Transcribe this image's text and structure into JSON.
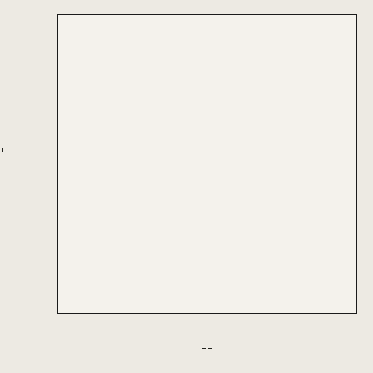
{
  "chart_data": {
    "type": "line",
    "title": "",
    "xlabel": "X = kθ / (ρ c r_m²) = αθ / r_m²",
    "ylabel": "Y_E = (t' - t_E) / (t' - t_b)",
    "xscale": "linear-then-compressed",
    "yscale": "log",
    "ylim": [
      0.01,
      1.0
    ],
    "xlim": [
      0,
      9
    ],
    "grid": true,
    "legend_position": "inline-curve-labels",
    "y_ticks": [
      "1.0",
      "0.8",
      "0.6",
      "0.5",
      "0.4",
      "0.3",
      "0.2",
      "0.15",
      "0.10",
      "0.08",
      "0.06",
      "0.05",
      "0.04",
      "0.03",
      "0.02",
      "0.015",
      "0.01"
    ],
    "y_tick_values": [
      1.0,
      0.8,
      0.6,
      0.5,
      0.4,
      0.3,
      0.2,
      0.15,
      0.1,
      0.08,
      0.06,
      0.05,
      0.04,
      0.03,
      0.02,
      0.015,
      0.01
    ],
    "x_ticks": [
      "0",
      "0.5",
      "1.0",
      "1.5",
      "2.0",
      "2.5",
      "3.0",
      "3.5",
      "4",
      "5",
      "6",
      "7",
      "8",
      "9"
    ],
    "x_tick_values": [
      0,
      0.5,
      1.0,
      1.5,
      2.0,
      2.5,
      3.0,
      3.5,
      4,
      5,
      6,
      7,
      8,
      9
    ],
    "series_parameter_symbol": "m",
    "series": [
      {
        "name": "m=80",
        "m": 80,
        "label": "m=80",
        "decay": 0.009,
        "break_x": 4.3
      },
      {
        "name": "50",
        "m": 50,
        "label": "50",
        "decay": 0.0142,
        "break_x": 4.25
      },
      {
        "name": "35",
        "m": 35,
        "label": "35",
        "decay": 0.0201,
        "break_x": 4.2
      },
      {
        "name": "25",
        "m": 25,
        "label": "25",
        "decay": 0.0278,
        "break_x": 4.15
      },
      {
        "name": "18",
        "m": 18,
        "label": "18",
        "decay": 0.0381,
        "break_x": 4.1
      },
      {
        "name": "14",
        "m": 14,
        "label": "14",
        "decay": 0.0486,
        "break_x": 4.05
      },
      {
        "name": "10",
        "m": 10,
        "label": "10",
        "decay": 0.067,
        "break_x": 4.0
      },
      {
        "name": "8",
        "m": 8,
        "label": "8",
        "decay": 0.083,
        "break_x": 3.95
      },
      {
        "name": "6.0",
        "m": 6.0,
        "label": "6.0",
        "decay": 0.109,
        "break_x": 3.9
      },
      {
        "name": "4.0",
        "m": 4.0,
        "label": "4.0",
        "decay": 0.158,
        "break_x": 3.85
      },
      {
        "name": "3.0",
        "m": 3.0,
        "label": "3.0",
        "decay": 0.205,
        "break_x": 3.8
      },
      {
        "name": "2.5",
        "m": 2.5,
        "label": "2.5",
        "decay": 0.242,
        "break_x": 3.75
      },
      {
        "name": "2.0",
        "m": 2.0,
        "label": "2.0",
        "decay": 0.296,
        "break_x": 3.7
      },
      {
        "name": "1.8",
        "m": 1.8,
        "label": "1.8",
        "decay": 0.325,
        "break_x": 3.65
      },
      {
        "name": "1.6",
        "m": 1.6,
        "label": "1.6",
        "decay": 0.36,
        "break_x": 3.6
      },
      {
        "name": "1.4",
        "m": 1.4,
        "label": "1.4",
        "decay": 0.405,
        "break_x": 3.55
      },
      {
        "name": "1.2",
        "m": 1.2,
        "label": "1.2",
        "decay": 0.462,
        "break_x": 3.5
      },
      {
        "name": "1.0",
        "m": 1.0,
        "label": "1.0",
        "decay": 0.54,
        "break_x": 3.4
      },
      {
        "name": "0.9",
        "m": 0.9,
        "label": "0.9",
        "decay": 0.59,
        "break_x": 3.35
      },
      {
        "name": "0.8",
        "m": 0.8,
        "label": "0.8",
        "decay": 0.65,
        "break_x": 3.3
      },
      {
        "name": "0.7",
        "m": 0.7,
        "label": "0.7",
        "decay": 0.725,
        "break_x": 3.25
      },
      {
        "name": "0.6",
        "m": 0.6,
        "label": "0.6",
        "decay": 0.82,
        "break_x": 3.2
      },
      {
        "name": "0.5",
        "m": 0.5,
        "label": "0.5",
        "decay": 0.95,
        "break_x": 3.15
      },
      {
        "name": "0.4",
        "m": 0.4,
        "label": "0.4",
        "decay": 1.13,
        "break_x": 3.1
      },
      {
        "name": "0.30",
        "m": 0.3,
        "label": "0.30",
        "decay": 1.4,
        "break_x": 3.05
      },
      {
        "name": "0.25",
        "m": 0.25,
        "label": "0.25",
        "decay": 1.6,
        "break_x": 3.0
      },
      {
        "name": "0.20",
        "m": 0.2,
        "label": "0.20",
        "decay": 1.86,
        "break_x": 2.95
      },
      {
        "name": "0.15",
        "m": 0.15,
        "label": "0.15",
        "decay": 2.2,
        "break_x": 2.9
      },
      {
        "name": "0.10",
        "m": 0.1,
        "label": "0.10",
        "decay": 2.7,
        "break_x": 2.85
      },
      {
        "name": "0.05",
        "m": 0.05,
        "label": "0.05",
        "decay": 3.4,
        "break_x": 2.8
      },
      {
        "name": "0",
        "m": 0,
        "label": "0",
        "decay": 4.1,
        "break_x": 2.75
      }
    ],
    "curve_labels_left_column": [
      "m=80",
      "50",
      "35",
      "25",
      "18",
      "14",
      "10",
      "8",
      "6",
      "4",
      "2.5",
      "1.5",
      "0.8",
      "0.5",
      "0.25",
      "0.15",
      "0.05",
      "0"
    ],
    "curve_labels_right_column": [
      "6.0",
      "4.0",
      "3.0",
      "2.0",
      "1.6",
      "1.2",
      "1.0",
      "0.9",
      "0.7",
      "0.5",
      "0.30",
      "0.20",
      "0.10"
    ],
    "annotations": []
  },
  "axes": {
    "x_title_lead": "X =",
    "x_frac1_num": "kθ",
    "x_frac1_den": "ρ c r",
    "x_frac1_den_sub": "m",
    "x_frac1_den_sup": "2",
    "x_eq": "=",
    "x_frac2_num": "α θ",
    "x_frac2_den": "r",
    "x_frac2_den_sub": "m",
    "x_frac2_den_sup": "2",
    "y_symbol": "Y",
    "y_symbol_sub": "E",
    "y_eq": "=",
    "y_frac_num": "t' - t",
    "y_frac_num_sub": "E",
    "y_frac_den": "t' - t",
    "y_frac_den_sub": "b"
  },
  "colors": {
    "paper": "#edeae3",
    "plot_bg": "#f4f2ec",
    "grid_minor": "#9a9a93",
    "grid_major": "#4a4a45",
    "frame": "#1b1b1b",
    "curve": "#15150f",
    "text": "#23231f"
  }
}
